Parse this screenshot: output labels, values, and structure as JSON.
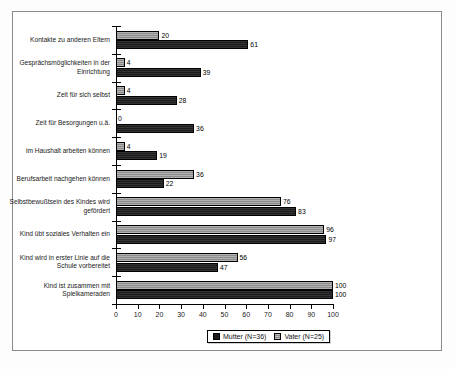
{
  "chart_data": {
    "type": "bar",
    "orientation": "horizontal",
    "title": "",
    "subtitle": "",
    "xlabel": "",
    "ylabel": "",
    "xlim": [
      0,
      100
    ],
    "xticks": [
      0,
      10,
      20,
      30,
      40,
      50,
      60,
      70,
      80,
      90,
      100
    ],
    "grid": false,
    "legend_position": "bottom",
    "categories": [
      "Kontakte zu anderen Eltern",
      "Gesprächsmöglichkeiten in der Einrichtung",
      "Zeit für sich selbst",
      "Zeit für Besorgungen u.ä.",
      "im Haushalt arbeiten können",
      "Berufsarbeit nachgehen können",
      "Selbstbewußtsein des Kindes wird gefördert",
      "Kind übt soziales Verhalten ein",
      "Kind wird in erster Linie auf die Schule vorbereitet",
      "Kind ist zusammen mit Spielkameraden"
    ],
    "series": [
      {
        "name": "Vater (N=25)",
        "color": "#8c8c8c",
        "values": [
          20,
          4,
          4,
          0,
          4,
          36,
          76,
          96,
          56,
          100
        ]
      },
      {
        "name": "Mutter (N=36)",
        "color": "#1c1c1c",
        "values": [
          61,
          39,
          28,
          36,
          19,
          22,
          83,
          97,
          47,
          100
        ]
      }
    ]
  },
  "legend": {
    "items": [
      {
        "label": "Mutter (N=36)",
        "swatch": "mutter"
      },
      {
        "label": "Vater (N=25)",
        "swatch": "vater"
      }
    ]
  }
}
